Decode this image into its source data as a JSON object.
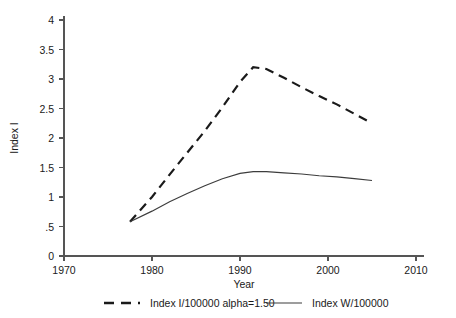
{
  "chart_data": {
    "type": "line",
    "title": "",
    "xlabel": "Year",
    "ylabel": "Index I",
    "xlim": [
      1970,
      2010
    ],
    "ylim": [
      0,
      4
    ],
    "grid": false,
    "legend_position": "bottom",
    "x_ticks": [
      "1970",
      "1980",
      "1990",
      "2000",
      "2010"
    ],
    "x_tick_values": [
      1970,
      1980,
      1990,
      2000,
      2010
    ],
    "y_ticks": [
      "0",
      ".5",
      "1",
      "1.5",
      "2",
      "2.5",
      "3",
      "3.5",
      "4"
    ],
    "y_tick_values": [
      0,
      0.5,
      1,
      1.5,
      2,
      2.5,
      3,
      3.5,
      4
    ],
    "series": [
      {
        "name": "Index I/100000 alpha=1.50",
        "style": "dashed",
        "color": "#1a1a1a",
        "x": [
          1977.5,
          1980,
          1982,
          1984,
          1986,
          1988,
          1990,
          1991.5,
          1993,
          1995,
          1997,
          1999,
          2001,
          2003,
          2005
        ],
        "values": [
          0.58,
          1.0,
          1.38,
          1.75,
          2.12,
          2.52,
          2.95,
          3.2,
          3.17,
          3.02,
          2.86,
          2.71,
          2.57,
          2.41,
          2.25
        ]
      },
      {
        "name": "Index W/100000",
        "style": "solid",
        "color": "#3d3d3d",
        "x": [
          1977.5,
          1980,
          1982,
          1984,
          1986,
          1988,
          1990,
          1991.5,
          1993,
          1995,
          1997,
          1999,
          2001,
          2003,
          2005
        ],
        "values": [
          0.58,
          0.76,
          0.92,
          1.06,
          1.19,
          1.31,
          1.4,
          1.43,
          1.43,
          1.41,
          1.39,
          1.36,
          1.34,
          1.31,
          1.28
        ]
      }
    ]
  },
  "legend": {
    "entries": [
      {
        "label": "Index I/100000 alpha=1.50",
        "style": "dashed"
      },
      {
        "label": "Index W/100000",
        "style": "solid"
      }
    ]
  },
  "axes": {
    "x_title": "Year",
    "y_title": "Index I"
  }
}
